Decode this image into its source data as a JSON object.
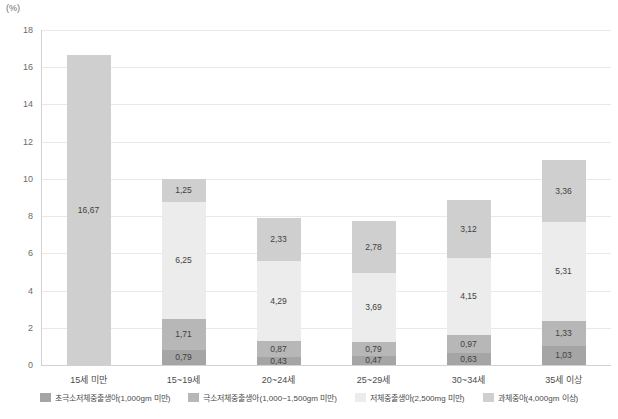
{
  "chart_data": {
    "type": "bar",
    "subtype": "stacked-bar",
    "title": "",
    "xlabel": "",
    "ylabel": "(%)",
    "unit": "(%)",
    "ylim": [
      0,
      18
    ],
    "ytick_step": 2,
    "yticks": [
      "18",
      "16",
      "14",
      "12",
      "10",
      "8",
      "6",
      "4",
      "2",
      "0"
    ],
    "grid": true,
    "legend_position": "bottom",
    "categories": [
      "15세 미만",
      "15~19세",
      "20~24세",
      "25~29세",
      "30~34세",
      "35세 이상"
    ],
    "series": [
      {
        "name": "초극소저체중출생아(1,000gm 미만)",
        "color": "#a5a5a5",
        "values": [
          null,
          0.79,
          0.43,
          0.47,
          0.63,
          1.03
        ],
        "labels": [
          "",
          "0,79",
          "0,43",
          "0,47",
          "0,63",
          "1,03"
        ]
      },
      {
        "name": "극소저체중출생아(1,000~1,500gm 미만)",
        "color": "#b7b7b7",
        "values": [
          null,
          1.71,
          0.87,
          0.79,
          0.97,
          1.33
        ],
        "labels": [
          "",
          "1,71",
          "0,87",
          "0,79",
          "0,97",
          "1,33"
        ]
      },
      {
        "name": "저체중출생아(2,500mg 미만)",
        "color": "#ececec",
        "values": [
          null,
          6.25,
          4.29,
          3.69,
          4.15,
          5.31
        ],
        "labels": [
          "",
          "6,25",
          "4,29",
          "3,69",
          "4,15",
          "5,31"
        ]
      },
      {
        "name": "과체중아(4,000gm 이상)",
        "color": "#cfcfcf",
        "values": [
          16.67,
          1.25,
          2.33,
          2.78,
          3.12,
          3.36
        ],
        "labels": [
          "16,67",
          "1,25",
          "2,33",
          "2,78",
          "3,12",
          "3,36"
        ]
      }
    ],
    "totals": [
      16.67,
      10.0,
      7.92,
      7.73,
      8.87,
      11.03
    ],
    "first_bar_note": "single solid segment rendered in the 과체중아 slot color family (#a5a5a5)"
  },
  "legend": {
    "items": [
      {
        "label": "초극소저체중출생아(1,000gm 미만)",
        "color": "#a5a5a5"
      },
      {
        "label": "극소저체중출생아(1,000~1,500gm 미만)",
        "color": "#b7b7b7"
      },
      {
        "label": "저체중출생아(2,500mg 미만)",
        "color": "#ececec"
      },
      {
        "label": "과체중아(4,000gm 이상)",
        "color": "#cfcfcf"
      }
    ]
  }
}
